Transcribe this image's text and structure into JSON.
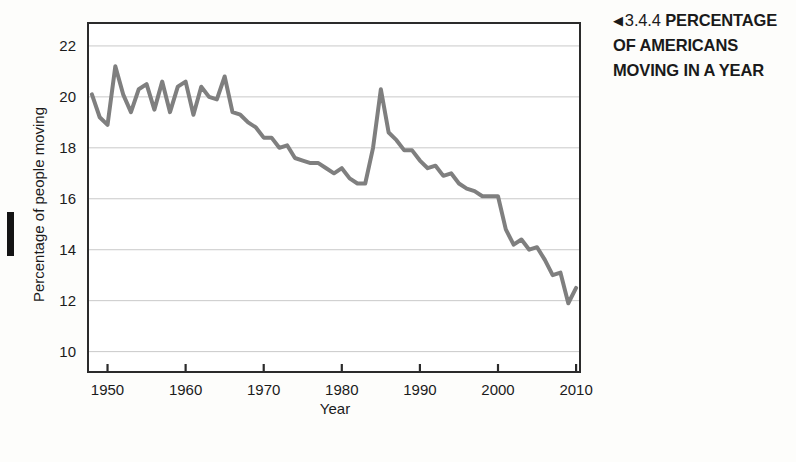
{
  "caption": {
    "arrow_icon": "◀",
    "number": "3.4.4",
    "title_line1": "PERCENTAGE",
    "title_line2": "OF AMERICANS",
    "title_line3": "MOVING IN A YEAR"
  },
  "colors": {
    "line": "#7f7f7f",
    "gridline": "#c9c9c9",
    "frame": "#2b2b2b",
    "background": "#fdfdfb",
    "text": "#1b1b1b"
  },
  "chart_data": {
    "type": "line",
    "title": "",
    "xlabel": "Year",
    "ylabel": "Percentage of people moving",
    "xlim": [
      1947.5,
      2010.5
    ],
    "ylim": [
      9.2,
      22.9
    ],
    "grid": true,
    "legend": "none",
    "xticks": [
      1950,
      1960,
      1970,
      1980,
      1990,
      2000,
      2010
    ],
    "yticks": [
      10,
      12,
      14,
      16,
      18,
      20,
      22
    ],
    "series": [
      {
        "name": "Percentage of Americans moving in a year",
        "x": [
          1948,
          1949,
          1950,
          1951,
          1952,
          1953,
          1954,
          1955,
          1956,
          1957,
          1958,
          1959,
          1960,
          1961,
          1962,
          1963,
          1964,
          1965,
          1966,
          1967,
          1968,
          1969,
          1970,
          1971,
          1972,
          1973,
          1974,
          1975,
          1976,
          1977,
          1978,
          1979,
          1980,
          1981,
          1982,
          1983,
          1984,
          1985,
          1986,
          1987,
          1988,
          1989,
          1990,
          1991,
          1992,
          1993,
          1994,
          1995,
          1996,
          1997,
          1998,
          1999,
          2000,
          2001,
          2002,
          2003,
          2004,
          2005,
          2006,
          2007,
          2008,
          2009,
          2010
        ],
        "values": [
          20.1,
          19.2,
          18.9,
          21.2,
          20.1,
          19.4,
          20.3,
          20.5,
          19.5,
          20.6,
          19.4,
          20.4,
          20.6,
          19.3,
          20.4,
          20.0,
          19.9,
          20.8,
          19.4,
          19.3,
          19.0,
          18.8,
          18.4,
          18.4,
          18.0,
          18.1,
          17.6,
          17.5,
          17.4,
          17.4,
          17.2,
          17.0,
          17.2,
          16.8,
          16.6,
          16.6,
          18.0,
          20.3,
          18.6,
          18.3,
          17.9,
          17.9,
          17.5,
          17.2,
          17.3,
          16.9,
          17.0,
          16.6,
          16.4,
          16.3,
          16.1,
          16.1,
          16.1,
          14.8,
          14.2,
          14.4,
          14.0,
          14.1,
          13.6,
          13.0,
          13.1,
          11.9,
          12.5
        ]
      }
    ]
  }
}
